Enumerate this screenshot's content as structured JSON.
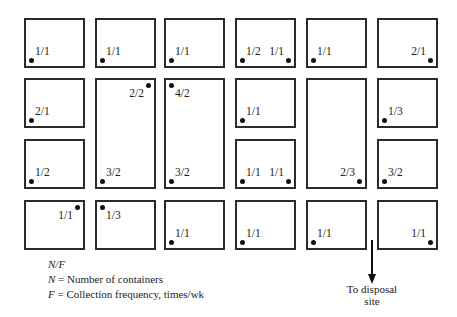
{
  "diagram": {
    "columns_x": [
      24,
      95,
      164,
      235,
      306,
      377
    ],
    "rows_y": [
      18,
      78,
      139,
      200
    ],
    "block_width": 61,
    "block_height": 50,
    "blocks": [
      {
        "id": "r1c1",
        "col": 0,
        "row": 0,
        "rowspan": 1,
        "points": [
          {
            "label": "1/1",
            "pos": "bl"
          }
        ]
      },
      {
        "id": "r1c2",
        "col": 1,
        "row": 0,
        "rowspan": 1,
        "points": [
          {
            "label": "1/1",
            "pos": "bl"
          }
        ]
      },
      {
        "id": "r1c3",
        "col": 2,
        "row": 0,
        "rowspan": 1,
        "points": [
          {
            "label": "1/1",
            "pos": "bl"
          }
        ]
      },
      {
        "id": "r1c4",
        "col": 3,
        "row": 0,
        "rowspan": 1,
        "points": [
          {
            "label": "1/2",
            "pos": "bl"
          },
          {
            "label": "1/1",
            "pos": "br"
          }
        ]
      },
      {
        "id": "r1c5",
        "col": 4,
        "row": 0,
        "rowspan": 1,
        "points": [
          {
            "label": "1/1",
            "pos": "bl"
          }
        ]
      },
      {
        "id": "r1c6",
        "col": 5,
        "row": 0,
        "rowspan": 1,
        "points": [
          {
            "label": "2/1",
            "pos": "br"
          }
        ]
      },
      {
        "id": "r2c1",
        "col": 0,
        "row": 1,
        "rowspan": 1,
        "points": [
          {
            "label": "2/1",
            "pos": "bl"
          }
        ]
      },
      {
        "id": "r23c2",
        "col": 1,
        "row": 1,
        "rowspan": 2,
        "points": [
          {
            "label": "2/2",
            "pos": "tr"
          },
          {
            "label": "3/2",
            "pos": "bl"
          }
        ]
      },
      {
        "id": "r23c3",
        "col": 2,
        "row": 1,
        "rowspan": 2,
        "points": [
          {
            "label": "4/2",
            "pos": "tl"
          },
          {
            "label": "3/2",
            "pos": "bl"
          }
        ]
      },
      {
        "id": "r2c4",
        "col": 3,
        "row": 1,
        "rowspan": 1,
        "points": [
          {
            "label": "1/1",
            "pos": "bl"
          }
        ]
      },
      {
        "id": "r23c5",
        "col": 4,
        "row": 1,
        "rowspan": 2,
        "points": [
          {
            "label": "2/3",
            "pos": "br"
          }
        ]
      },
      {
        "id": "r2c6",
        "col": 5,
        "row": 1,
        "rowspan": 1,
        "points": [
          {
            "label": "1/3",
            "pos": "bl"
          }
        ]
      },
      {
        "id": "r3c1",
        "col": 0,
        "row": 2,
        "rowspan": 1,
        "points": [
          {
            "label": "1/2",
            "pos": "bl"
          }
        ]
      },
      {
        "id": "r3c4",
        "col": 3,
        "row": 2,
        "rowspan": 1,
        "points": [
          {
            "label": "1/1",
            "pos": "bl"
          },
          {
            "label": "1/1",
            "pos": "br"
          }
        ]
      },
      {
        "id": "r3c6",
        "col": 5,
        "row": 2,
        "rowspan": 1,
        "points": [
          {
            "label": "3/2",
            "pos": "bl"
          }
        ]
      },
      {
        "id": "r4c1",
        "col": 0,
        "row": 3,
        "rowspan": 1,
        "points": [
          {
            "label": "1/1",
            "pos": "tr"
          }
        ]
      },
      {
        "id": "r4c2",
        "col": 1,
        "row": 3,
        "rowspan": 1,
        "points": [
          {
            "label": "1/3",
            "pos": "tl"
          }
        ]
      },
      {
        "id": "r4c3",
        "col": 2,
        "row": 3,
        "rowspan": 1,
        "points": [
          {
            "label": "1/1",
            "pos": "bl"
          }
        ]
      },
      {
        "id": "r4c4",
        "col": 3,
        "row": 3,
        "rowspan": 1,
        "points": [
          {
            "label": "1/1",
            "pos": "bl"
          }
        ]
      },
      {
        "id": "r4c5",
        "col": 4,
        "row": 3,
        "rowspan": 1,
        "points": [
          {
            "label": "1/1",
            "pos": "bl"
          }
        ]
      },
      {
        "id": "r4c6",
        "col": 5,
        "row": 3,
        "rowspan": 1,
        "points": [
          {
            "label": "1/1",
            "pos": "br"
          }
        ]
      }
    ]
  },
  "legend": {
    "notation": "N/F",
    "line_n_symbol": "N",
    "line_n_text": "= Number of containers",
    "line_f_symbol": "F",
    "line_f_text": "= Collection frequency, times/wk"
  },
  "disposal": {
    "line1": "To disposal",
    "line2": "site"
  }
}
